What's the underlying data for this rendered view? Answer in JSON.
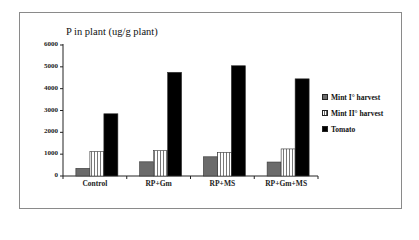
{
  "chart_data": {
    "type": "bar",
    "title": "P in plant (ug/g plant)",
    "xlabel": "",
    "ylabel": "P in plant (ug/g plant)",
    "ylim": [
      0,
      6000
    ],
    "yticks": [
      0,
      1000,
      2000,
      3000,
      4000,
      5000,
      6000
    ],
    "categories": [
      "Control",
      "RP+Gm",
      "RP+MS",
      "RP+Gm+MS"
    ],
    "series": [
      {
        "name": "Mint I° harvest",
        "values": [
          350,
          650,
          880,
          640
        ],
        "color": "#6b6b6b",
        "pattern": "solid-gray"
      },
      {
        "name": "Mint II° harvest",
        "values": [
          1120,
          1160,
          1080,
          1240
        ],
        "color": "#ffffff",
        "pattern": "vertical-stripes"
      },
      {
        "name": "Tomato",
        "values": [
          2850,
          4750,
          5050,
          4450
        ],
        "color": "#000000",
        "pattern": "solid-black"
      }
    ],
    "legend_position": "right",
    "grid": false
  },
  "legend": {
    "items": [
      "Mint I° harvest",
      "Mint II° harvest",
      "Tomato"
    ]
  }
}
